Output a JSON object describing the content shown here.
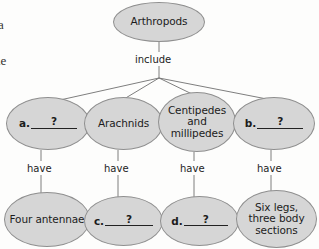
{
  "diagram": {
    "type": "concept-map",
    "root": {
      "label": "Arthropods"
    },
    "relation_top": "include",
    "relation_branch": "have",
    "level1": [
      {
        "id": "a",
        "kind": "blank",
        "blank_label": "a.",
        "question_mark": "?",
        "label": ""
      },
      {
        "id": "arach",
        "kind": "text",
        "label": "Arachnids"
      },
      {
        "id": "centi",
        "kind": "text",
        "label": "Centipedes and millipedes"
      },
      {
        "id": "b",
        "kind": "blank",
        "blank_label": "b.",
        "question_mark": "?",
        "label": ""
      }
    ],
    "level2": [
      {
        "id": "four",
        "kind": "text",
        "label": "Four antennae"
      },
      {
        "id": "c",
        "kind": "blank",
        "blank_label": "c.",
        "question_mark": "?",
        "label": ""
      },
      {
        "id": "d",
        "kind": "blank",
        "blank_label": "d.",
        "question_mark": "?",
        "label": ""
      },
      {
        "id": "six",
        "kind": "text",
        "label": "Six legs, three body sections"
      }
    ],
    "edge_labels": {
      "include": "include",
      "have_1": "have",
      "have_2": "have",
      "have_3": "have",
      "have_4": "have"
    },
    "colors": {
      "node_fill": "#d6d6d6",
      "node_stroke": "#8f8f8f",
      "connector": "#6f6f6f",
      "text": "#1c1c1c",
      "page": "#fdfdfc"
    }
  },
  "page_artifacts": {
    "left_margin_fragment_top": "",
    "left_margin_fragment_1": "a",
    "left_margin_fragment_2": "ne"
  }
}
